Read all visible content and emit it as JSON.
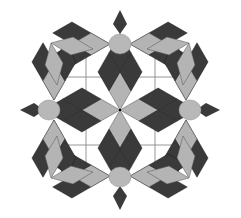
{
  "figure": {
    "title": "",
    "colors": {
      "background": "#ffffff",
      "dark_rhombus": "#3a3a3a",
      "light_rhombus": "#b4b4b4",
      "hub": "#b8b8b8",
      "grid_line": "#8a8a8a"
    },
    "center": [
      120,
      110
    ],
    "hubs": [
      {
        "name": "top",
        "cx": 120,
        "cy": 44,
        "r": 10
      },
      {
        "name": "bottom",
        "cx": 120,
        "cy": 177,
        "r": 10
      },
      {
        "name": "left",
        "cx": 49,
        "cy": 110,
        "r": 10
      },
      {
        "name": "right",
        "cx": 190,
        "cy": 110,
        "r": 10
      }
    ],
    "grid_lines": {
      "vertical_x": [
        86,
        155
      ],
      "horizontal_y": [
        77,
        145
      ]
    }
  }
}
